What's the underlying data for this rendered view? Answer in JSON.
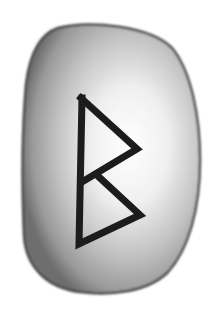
{
  "image": {
    "subject": "rune stone",
    "rune_name": "Berkano",
    "rune_glyph": "ᛒ",
    "colors": {
      "background": "#ffffff",
      "stone_edge": "#5a5a5a",
      "stone_mid": "#9a9a9a",
      "stone_highlight": "#f4f4f4",
      "rune_stroke": "#1c1c1c"
    }
  }
}
